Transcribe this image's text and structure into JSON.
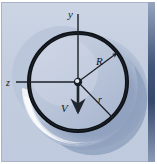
{
  "figure": {
    "type": "technical-illustration",
    "width": 157,
    "height": 164,
    "labels": [
      {
        "id": "y-axis-label",
        "text": "y",
        "x": 68,
        "y": 18,
        "size": 11
      },
      {
        "id": "z-axis-label",
        "text": "z",
        "x": 9,
        "y": 85,
        "size": 10
      },
      {
        "id": "R-radius-label",
        "text": "R",
        "x": 98,
        "y": 65,
        "size": 11
      },
      {
        "id": "r-radius-label",
        "text": "r",
        "x": 98,
        "y": 100,
        "size": 10
      },
      {
        "id": "V-velocity-label",
        "text": "V",
        "x": 62,
        "y": 110,
        "size": 11
      }
    ],
    "colors": {
      "background": "#c3cddf",
      "background_top": "#ccd5e4",
      "border": "#9aa6bb",
      "right_edge_strip": "#6d7f9c",
      "shadow_dark": "#8fa0bd",
      "shadow_mid": "#a6b3cb",
      "disc_fill": "#b3c0d6",
      "disc_fill_light": "#c6d0e1",
      "highlight_white": "#f2f4f8",
      "ring_dark": "#101418",
      "axis_line": "#1b2026",
      "hub": "#1a1f26",
      "label_text": "#141820"
    },
    "geometry": {
      "center": {
        "x": 78,
        "y": 82
      },
      "outer_radius": 52,
      "inner_radius": 45,
      "ring_thickness": 4,
      "hub_radius": 4
    },
    "vectors": [
      {
        "id": "y-axis",
        "from": "center",
        "direction": "up",
        "label": "y"
      },
      {
        "id": "z-axis",
        "from": "center",
        "direction": "left",
        "label": "z"
      },
      {
        "id": "R-radius",
        "from": "center",
        "direction": "up-right",
        "label": "R"
      },
      {
        "id": "r-radius",
        "from": "center",
        "direction": "down-right",
        "label": "r"
      },
      {
        "id": "V-velocity",
        "from": "center",
        "direction": "down",
        "label": "V"
      }
    ]
  }
}
